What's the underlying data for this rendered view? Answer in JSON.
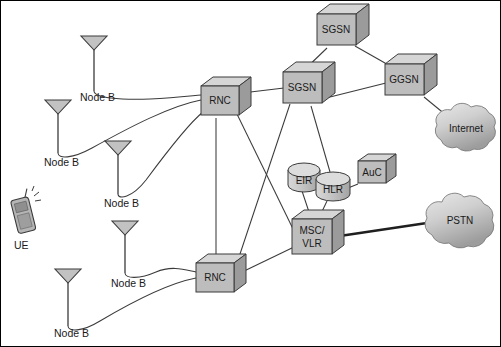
{
  "diagram": {
    "background_color": "#ffffff",
    "border_color": "#000000",
    "palette": {
      "box_face": "#bdbdbd",
      "box_top": "#d6d6d6",
      "box_side": "#9b9b9b",
      "outline": "#3b3b3b",
      "cloud_fill": "#c9c9c9",
      "link": "#3b3b3b",
      "link_thick": "#1f1f1f",
      "text": "#1a1a1a"
    },
    "nodes": [
      {
        "id": "nodeb1",
        "type": "antenna",
        "label": "Node B",
        "x": 94,
        "y": 42,
        "label_x": 80,
        "label_y": 101
      },
      {
        "id": "nodeb2",
        "type": "antenna",
        "label": "Node B",
        "x": 58,
        "y": 106,
        "label_x": 44,
        "label_y": 166
      },
      {
        "id": "nodeb3",
        "type": "antenna",
        "label": "Node B",
        "x": 118,
        "y": 146,
        "label_x": 104,
        "label_y": 207
      },
      {
        "id": "nodeb4",
        "type": "antenna",
        "label": "Node B",
        "x": 125,
        "y": 226,
        "label_x": 111,
        "label_y": 287
      },
      {
        "id": "nodeb5",
        "type": "antenna",
        "label": "Node B",
        "x": 68,
        "y": 274,
        "label_x": 54,
        "label_y": 337
      },
      {
        "id": "ue",
        "type": "handset",
        "label": "UE",
        "x": 24,
        "y": 214,
        "label_x": 14,
        "label_y": 249
      },
      {
        "id": "rnc1",
        "type": "box",
        "label": "RNC",
        "x": 200,
        "y": 86,
        "w": 38,
        "h": 28
      },
      {
        "id": "rnc2",
        "type": "box",
        "label": "RNC",
        "x": 195,
        "y": 263,
        "w": 38,
        "h": 28
      },
      {
        "id": "sgsn_top",
        "type": "box",
        "label": "SGSN",
        "x": 317,
        "y": 14,
        "w": 40,
        "h": 30
      },
      {
        "id": "sgsn",
        "type": "box",
        "label": "SGSN",
        "x": 283,
        "y": 72,
        "w": 40,
        "h": 30
      },
      {
        "id": "ggsn",
        "type": "box",
        "label": "GGSN",
        "x": 385,
        "y": 64,
        "w": 40,
        "h": 30
      },
      {
        "id": "auc",
        "type": "box",
        "label": "AuC",
        "x": 358,
        "y": 161,
        "w": 30,
        "h": 22
      },
      {
        "id": "msc",
        "type": "box",
        "label": "MSC/\nVLR",
        "x": 292,
        "y": 219,
        "w": 40,
        "h": 34
      },
      {
        "id": "eir",
        "type": "cylinder",
        "label": "EIR",
        "x": 288,
        "y": 163,
        "w": 33,
        "h": 29
      },
      {
        "id": "hlr",
        "type": "cylinder",
        "label": "HLR",
        "x": 316,
        "y": 172,
        "w": 34,
        "h": 29
      },
      {
        "id": "internet",
        "type": "cloud",
        "label": "Internet",
        "x": 434,
        "y": 104,
        "w": 66,
        "h": 52
      },
      {
        "id": "pstn",
        "type": "cloud",
        "label": "PSTN",
        "x": 424,
        "y": 192,
        "w": 76,
        "h": 60
      }
    ],
    "links": [
      {
        "from": "nodeb1",
        "to": "rnc1",
        "style": "curved"
      },
      {
        "from": "nodeb2",
        "to": "rnc1",
        "style": "curved"
      },
      {
        "from": "nodeb3",
        "to": "rnc1",
        "style": "curved"
      },
      {
        "from": "nodeb4",
        "to": "rnc2",
        "style": "curved"
      },
      {
        "from": "nodeb5",
        "to": "rnc2",
        "style": "curved"
      },
      {
        "from": "rnc1",
        "to": "rnc2",
        "style": "straight"
      },
      {
        "from": "rnc1",
        "to": "sgsn",
        "style": "straight"
      },
      {
        "from": "rnc1",
        "to": "msc",
        "style": "straight"
      },
      {
        "from": "rnc2",
        "to": "sgsn",
        "style": "straight"
      },
      {
        "from": "rnc2",
        "to": "msc",
        "style": "straight"
      },
      {
        "from": "sgsn",
        "to": "sgsn_top",
        "style": "straight"
      },
      {
        "from": "sgsn",
        "to": "ggsn",
        "style": "straight"
      },
      {
        "from": "sgsn_top",
        "to": "ggsn",
        "style": "straight"
      },
      {
        "from": "sgsn",
        "to": "hlr",
        "style": "straight"
      },
      {
        "from": "ggsn",
        "to": "internet",
        "style": "straight"
      },
      {
        "from": "eir",
        "to": "msc",
        "style": "straight"
      },
      {
        "from": "hlr",
        "to": "msc",
        "style": "straight"
      },
      {
        "from": "auc",
        "to": "hlr",
        "style": "straight"
      },
      {
        "from": "msc",
        "to": "pstn",
        "style": "thick"
      }
    ]
  }
}
